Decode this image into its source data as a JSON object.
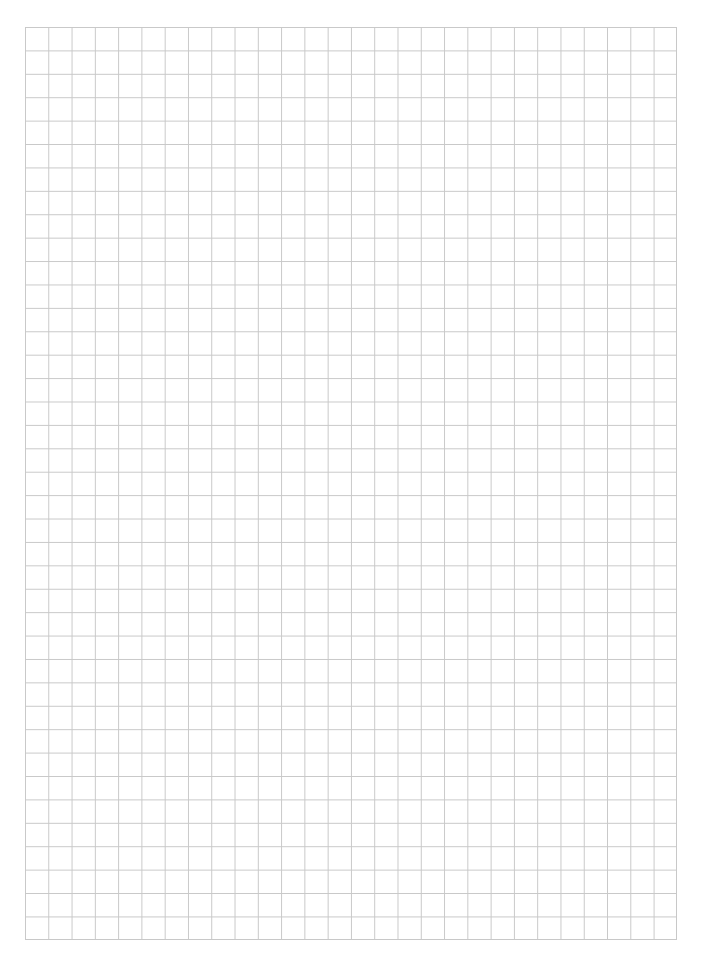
{
  "page": {
    "type": "graph-paper",
    "background_color": "#ffffff",
    "grid": {
      "line_color": "#c8c8c8",
      "columns": 28,
      "rows": 39,
      "left": 25,
      "top": 27,
      "width": 652,
      "height": 913
    }
  }
}
